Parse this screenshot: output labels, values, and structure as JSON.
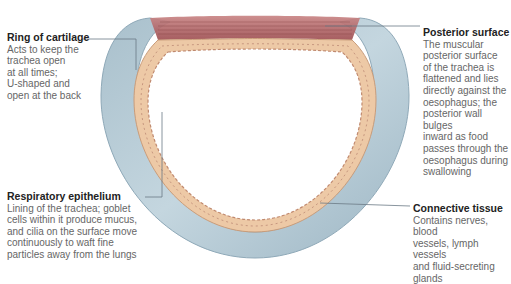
{
  "figure": {
    "colors": {
      "cartilage": "#b9cdd8",
      "cartilage_edge": "#8fa9b8",
      "epithelium": "#edc9a6",
      "epithelium_detail": "#b07a6a",
      "muscle": "#a8585a",
      "leader_line": "#6b7a85",
      "heading_text": "#222222",
      "body_text": "#666666"
    }
  },
  "labels": [
    {
      "id": "ring-of-cartilage",
      "heading": "Ring of cartilage",
      "body": "Acts to keep the\ntrachea open\nat all times;\nU-shaped and\nopen at the back"
    },
    {
      "id": "posterior-surface",
      "heading": "Posterior surface",
      "body": "The muscular\nposterior surface\nof the trachea is\nflattened and lies\ndirectly against the\noesophagus; the\nposterior wall bulges\ninward as food\npasses through the\noesophagus during\nswallowing"
    },
    {
      "id": "respiratory-epithelium",
      "heading": "Respiratory epithelium",
      "body": "Lining of the trachea; goblet\ncells within it produce mucus,\nand cilia on the surface move\ncontinuously to waft fine\nparticles away from the lungs"
    },
    {
      "id": "connective-tissue",
      "heading": "Connective tissue",
      "body": "Contains nerves, blood\nvessels, lymph vessels\nand fluid-secreting\nglands"
    }
  ]
}
